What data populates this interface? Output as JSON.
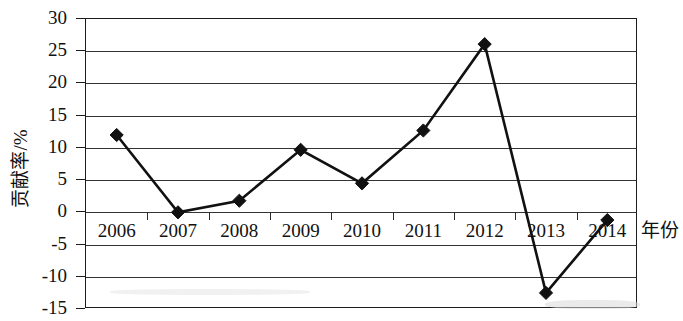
{
  "chart_data": {
    "type": "line",
    "title": "",
    "xlabel": "年份",
    "ylabel": "贡献率/%",
    "categories": [
      "2006",
      "2007",
      "2008",
      "2009",
      "2010",
      "2011",
      "2012",
      "2013",
      "2014"
    ],
    "values": [
      12.0,
      0.0,
      1.8,
      9.7,
      4.5,
      12.7,
      26.1,
      -12.5,
      -1.2
    ],
    "series": [
      {
        "name": "贡献率",
        "values": [
          12.0,
          0.0,
          1.8,
          9.7,
          4.5,
          12.7,
          26.1,
          -12.5,
          -1.2
        ]
      }
    ],
    "ylim": [
      -15,
      30
    ],
    "ytick_labels": [
      "30",
      "25",
      "20",
      "15",
      "10",
      "5",
      "0",
      "-5",
      "-10",
      "-15"
    ],
    "ytick_values": [
      30,
      25,
      20,
      15,
      10,
      5,
      0,
      -5,
      -10,
      -15
    ],
    "grid": true,
    "legend": "none",
    "marker": "filled-diamond",
    "line_color": "#111111",
    "marker_color": "#111111",
    "grid_color": "#333333",
    "frame_color": "#1c1c1c",
    "background_color": "#ffffff"
  }
}
